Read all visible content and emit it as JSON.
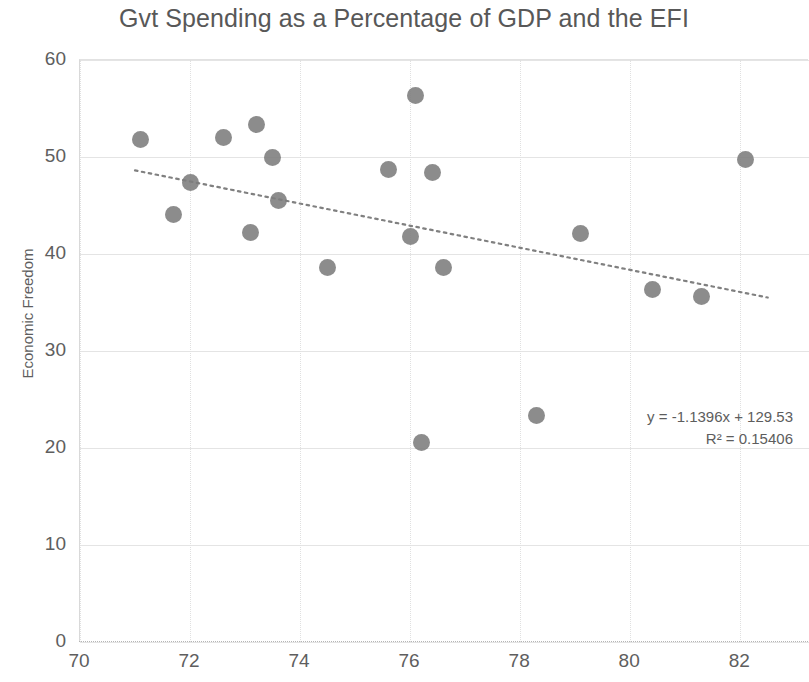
{
  "chart_data": {
    "type": "scatter",
    "title": "Gvt Spending as a Percentage of GDP and the EFI",
    "xlabel": "",
    "ylabel": "Economic Freedom",
    "xlim": [
      70,
      83.25
    ],
    "ylim": [
      0,
      60
    ],
    "xticks": [
      70,
      72,
      74,
      76,
      78,
      80,
      82
    ],
    "yticks": [
      0,
      10,
      20,
      30,
      40,
      50,
      60
    ],
    "grid": true,
    "legend": false,
    "marker_color": "#7c7c7c",
    "trendline_color": "#808080",
    "points": [
      {
        "x": 71.1,
        "y": 51.8
      },
      {
        "x": 71.7,
        "y": 44.1
      },
      {
        "x": 72.0,
        "y": 47.4
      },
      {
        "x": 72.6,
        "y": 52.0
      },
      {
        "x": 73.1,
        "y": 42.2
      },
      {
        "x": 73.2,
        "y": 53.4
      },
      {
        "x": 73.5,
        "y": 49.9
      },
      {
        "x": 73.6,
        "y": 45.5
      },
      {
        "x": 74.5,
        "y": 38.6
      },
      {
        "x": 75.6,
        "y": 48.7
      },
      {
        "x": 76.0,
        "y": 41.8
      },
      {
        "x": 76.1,
        "y": 56.3
      },
      {
        "x": 76.2,
        "y": 20.6
      },
      {
        "x": 76.4,
        "y": 48.4
      },
      {
        "x": 76.6,
        "y": 38.6
      },
      {
        "x": 78.3,
        "y": 23.4
      },
      {
        "x": 79.1,
        "y": 42.1
      },
      {
        "x": 80.4,
        "y": 36.3
      },
      {
        "x": 81.3,
        "y": 35.6
      },
      {
        "x": 82.1,
        "y": 49.7
      }
    ],
    "trendline": {
      "slope": -1.1396,
      "intercept": 129.53,
      "x_start": 71.0,
      "x_end": 82.5,
      "style": "dotted"
    },
    "annotations": {
      "equation": "y = -1.1396x + 129.53",
      "r_squared": "R² = 0.15406"
    }
  }
}
